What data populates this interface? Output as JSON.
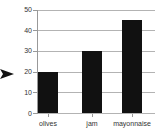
{
  "chart_data": {
    "type": "bar",
    "title": "",
    "xlabel": "",
    "ylabel": "",
    "categories": [
      "olives",
      "jam",
      "mayonnaise"
    ],
    "values": [
      20,
      30,
      45
    ],
    "ylim": [
      0,
      50
    ],
    "yticks": [
      0,
      10,
      20,
      30,
      40,
      50
    ],
    "grid": true,
    "legend_position": "none",
    "bar_color": "#111111",
    "gridline_color": "#b3b3b3",
    "axis_color": "#999999",
    "text_color": "#333333",
    "background_color": "#ffffff",
    "annotations": [
      {
        "type": "arrow-right-marker",
        "at_value": 20,
        "color": "#111111"
      }
    ]
  }
}
